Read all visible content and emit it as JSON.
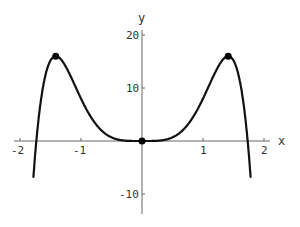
{
  "chart_data": {
    "type": "line",
    "title": "",
    "xlabel": "x",
    "ylabel": "y",
    "xlim": [
      -2.0,
      2.0
    ],
    "ylim": [
      -14,
      20
    ],
    "grid": false,
    "legend": null,
    "x_ticks": [
      -2,
      -1,
      1,
      2
    ],
    "y_ticks": [
      -10,
      10,
      20
    ],
    "function": "y = 12x^4 - 4x^6",
    "series": [
      {
        "name": "curve",
        "x": [
          -1.78,
          -1.75,
          -1.732,
          -1.7,
          -1.6,
          -1.5,
          -1.414,
          -1.3,
          -1.2,
          -1.0,
          -0.8,
          -0.6,
          -0.4,
          -0.2,
          0.0,
          0.2,
          0.4,
          0.6,
          0.8,
          1.0,
          1.2,
          1.3,
          1.414,
          1.5,
          1.6,
          1.7,
          1.732,
          1.75,
          1.78
        ],
        "values": [
          -13.6,
          -2.7,
          0.0,
          4.7,
          11.8,
          15.2,
          16.0,
          15.0,
          12.5,
          8.0,
          3.8,
          1.4,
          0.3,
          0.02,
          0.0,
          0.02,
          0.3,
          1.4,
          3.8,
          8.0,
          12.5,
          15.0,
          16.0,
          15.2,
          11.8,
          4.7,
          0.0,
          -2.7,
          -13.6
        ]
      }
    ],
    "marked_points": [
      {
        "x": -1.414,
        "y": 16
      },
      {
        "x": 0,
        "y": 0
      },
      {
        "x": 1.414,
        "y": 16
      }
    ]
  },
  "labels": {
    "x_axis": "x",
    "y_axis": "y",
    "x_tick_neg2": "-2",
    "x_tick_neg1": "-1",
    "x_tick_1": "1",
    "x_tick_2": "2",
    "y_tick_20": "20",
    "y_tick_10": "10",
    "y_tick_neg10": "-10"
  },
  "colors": {
    "curve": "#111111",
    "axes": "#555555",
    "background": "#ffffff"
  }
}
